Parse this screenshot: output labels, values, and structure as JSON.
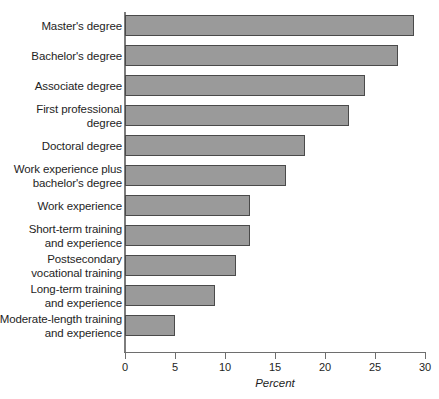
{
  "chart_data": {
    "type": "bar",
    "orientation": "horizontal",
    "title": "",
    "xlabel": "Percent",
    "ylabel": "",
    "xlim": [
      0,
      30
    ],
    "xticks": [
      0,
      5,
      10,
      15,
      20,
      25,
      30
    ],
    "grid": false,
    "legend": null,
    "bar_color": "#9a9a9a",
    "bar_edge_color": "#4a4a4a",
    "categories": [
      "Master's degree",
      "Bachelor's degree",
      "Associate degree",
      "First professional degree",
      "Doctoral degree",
      "Work experience plus bachelor's degree",
      "Work experience",
      "Short-term training and experience",
      "Postsecondary vocational training",
      "Long-term training and experience",
      "Moderate-length training and experience"
    ],
    "category_lines": [
      [
        "Master's degree"
      ],
      [
        "Bachelor's degree"
      ],
      [
        "Associate degree"
      ],
      [
        "First professional",
        "degree"
      ],
      [
        "Doctoral degree"
      ],
      [
        "Work experience plus",
        "bachelor's degree"
      ],
      [
        "Work experience"
      ],
      [
        "Short-term training",
        "and experience"
      ],
      [
        "Postsecondary",
        "vocational training"
      ],
      [
        "Long-term training",
        "and experience"
      ],
      [
        "Moderate-length training",
        "and experience"
      ]
    ],
    "values": [
      28.9,
      27.3,
      24.0,
      22.4,
      18.0,
      16.1,
      12.5,
      12.5,
      11.1,
      9.0,
      5.0
    ]
  }
}
